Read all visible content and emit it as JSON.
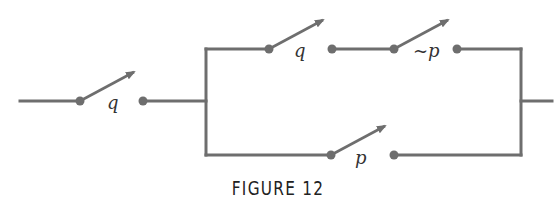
{
  "figure": {
    "caption": "FIGURE 12"
  },
  "circuit": {
    "description": "Switching circuit: switch q in series with a parallel block; upper branch has switches q and ~p in series, lower branch has switch p.",
    "switches": [
      {
        "id": "s1",
        "label": "q",
        "branch": "main-series"
      },
      {
        "id": "s2",
        "label": "q",
        "branch": "upper"
      },
      {
        "id": "s3",
        "label": "~p",
        "branch": "upper"
      },
      {
        "id": "s4",
        "label": "p",
        "branch": "lower"
      }
    ],
    "colors": {
      "wire": "#6e6e6e",
      "text": "#333333"
    }
  }
}
